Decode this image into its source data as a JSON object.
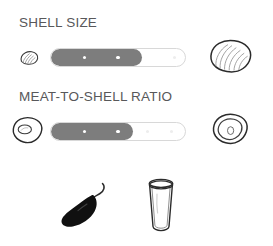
{
  "colors": {
    "text": "#58585a",
    "track_fill": "#7d7d7d",
    "track_empty": "#ffffff",
    "track_border": "#d8d8d8",
    "tick_on": "#ffffff",
    "tick_off": "#ededed",
    "outline": "#2b2b2b",
    "chili": "#101010",
    "background": "#ffffff"
  },
  "ratings": [
    {
      "label": "SHELL SIZE",
      "icon_left": "small-clam-shell-icon",
      "icon_right": "large-clam-shell-icon",
      "fill_percent": 68,
      "ticks_on": [
        25,
        50,
        75
      ],
      "ticks_off": [
        92
      ],
      "value": 3,
      "max": 4
    },
    {
      "label": "MEAT-TO-SHELL RATIO",
      "icon_left": "small-meat-oyster-icon",
      "icon_right": "large-meat-oyster-icon",
      "fill_percent": 61,
      "ticks_on": [
        25,
        50
      ],
      "ticks_off": [
        72,
        90
      ],
      "value": 2,
      "max": 4
    }
  ],
  "attributes": [
    {
      "icon": "chili-pepper-icon",
      "label": "chili-pepper"
    },
    {
      "icon": "drinking-glass-icon",
      "label": "drinking-glass"
    }
  ]
}
